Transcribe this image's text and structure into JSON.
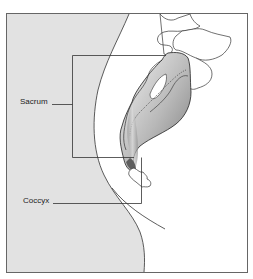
{
  "figure": {
    "labels": [
      {
        "id": "sacrum",
        "text": "Sacrum"
      },
      {
        "id": "coccyx",
        "text": "Coccyx"
      }
    ]
  },
  "colors": {
    "body_fill": "#e2e2e2",
    "frame": "#555555",
    "bone_light": "#f2f2f2",
    "bone_dark": "#8a8a8a",
    "outline": "#222222"
  }
}
